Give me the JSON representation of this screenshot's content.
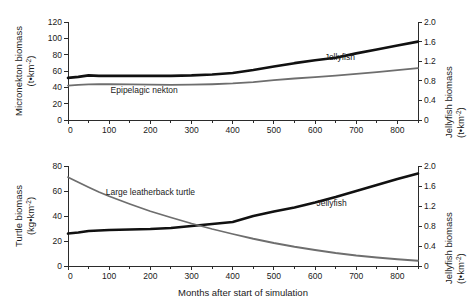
{
  "figure": {
    "xlabel": "Months after start of simulation",
    "background": "#ffffff",
    "series_colors": {
      "jellyfish": "#111111",
      "other": "#6e6e6e"
    }
  },
  "chart_data": [
    {
      "id": "top",
      "type": "line",
      "title": "",
      "xlabel": "",
      "ylabel": "Micronekton biomass (t•km⁻²)",
      "ylabel_line1": "Micronekton biomass",
      "ylabel_line2": "(t•km",
      "ylabel_line2_sup": "-2",
      "ylabel_line2_end": ")",
      "y2label_line1": "Jellyfish biomass",
      "y2label_line2": "(t•km",
      "y2label_line2_sup": "-2",
      "y2label_line2_end": ")",
      "xlim": [
        0,
        850
      ],
      "ylim": [
        0,
        120
      ],
      "y2lim": [
        0,
        2.0
      ],
      "xticks": [
        0,
        100,
        200,
        300,
        400,
        500,
        600,
        700,
        800
      ],
      "xminorticks": [
        50,
        150,
        250,
        350,
        450,
        550,
        650,
        750,
        850
      ],
      "yticks": [
        0,
        20,
        40,
        60,
        80,
        100,
        120
      ],
      "y2ticks": [
        0,
        0.4,
        0.8,
        1.2,
        1.6,
        2.0
      ],
      "y2ticklabels": [
        "0",
        "0.4",
        "0.8",
        "1.2",
        "1.6",
        "2.0"
      ],
      "grid": false,
      "legend_position": "inline-annotations",
      "series": [
        {
          "name": "Jellyfish",
          "axis": "right",
          "color": "#111111",
          "width": 2.6,
          "label": "Jellyfish",
          "label_x": 660,
          "label_y": 1.22,
          "x": [
            0,
            25,
            50,
            75,
            100,
            150,
            200,
            250,
            300,
            350,
            400,
            450,
            500,
            550,
            600,
            650,
            700,
            750,
            800,
            850
          ],
          "y": [
            0.86,
            0.88,
            0.91,
            0.9,
            0.9,
            0.9,
            0.9,
            0.9,
            0.91,
            0.93,
            0.96,
            1.02,
            1.09,
            1.16,
            1.22,
            1.27,
            1.36,
            1.44,
            1.52,
            1.6
          ]
        },
        {
          "name": "Epipelagic nekton",
          "axis": "left",
          "color": "#6e6e6e",
          "width": 1.8,
          "label": "Epipelagic nekton",
          "label_x": 185,
          "label_y": 33,
          "x": [
            0,
            25,
            50,
            75,
            100,
            150,
            200,
            250,
            300,
            350,
            400,
            450,
            500,
            550,
            600,
            650,
            700,
            750,
            800,
            850
          ],
          "y": [
            42.0,
            43.0,
            43.6,
            43.8,
            43.8,
            43.6,
            43.3,
            43.0,
            43.2,
            43.8,
            44.8,
            46.5,
            48.8,
            50.8,
            52.6,
            54.4,
            56.4,
            58.6,
            61.0,
            63.5
          ]
        }
      ]
    },
    {
      "id": "bottom",
      "type": "line",
      "title": "",
      "xlabel": "Months after start of simulation",
      "ylabel": "Turtle biomass (kg•km⁻²)",
      "ylabel_line1": "Turtle biomass",
      "ylabel_line2": "(kg•km",
      "ylabel_line2_sup": "-2",
      "ylabel_line2_end": ")",
      "y2label_line1": "Jellyfish biomass",
      "y2label_line2": "(t•km",
      "y2label_line2_sup": "-2",
      "y2label_line2_end": ")",
      "xlim": [
        0,
        850
      ],
      "ylim": [
        0,
        80
      ],
      "y2lim": [
        0,
        2.0
      ],
      "xticks": [
        0,
        100,
        200,
        300,
        400,
        500,
        600,
        700,
        800
      ],
      "xminorticks": [
        50,
        150,
        250,
        350,
        450,
        550,
        650,
        750,
        850
      ],
      "yticks": [
        0,
        20,
        40,
        60,
        80
      ],
      "y2ticks": [
        0,
        0.4,
        0.8,
        1.2,
        1.6,
        2.0
      ],
      "y2ticklabels": [
        "0",
        "0.4",
        "0.8",
        "1.2",
        "1.6",
        "2.0"
      ],
      "grid": false,
      "legend_position": "inline-annotations",
      "series": [
        {
          "name": "Jellyfish",
          "axis": "right",
          "color": "#111111",
          "width": 2.6,
          "label": "Jellyfish",
          "label_x": 640,
          "label_y": 1.2,
          "x": [
            0,
            25,
            50,
            75,
            100,
            150,
            200,
            250,
            300,
            350,
            400,
            450,
            500,
            550,
            600,
            650,
            700,
            750,
            800,
            850
          ],
          "y": [
            0.65,
            0.67,
            0.7,
            0.71,
            0.72,
            0.73,
            0.74,
            0.76,
            0.8,
            0.84,
            0.88,
            1.0,
            1.09,
            1.17,
            1.27,
            1.38,
            1.5,
            1.62,
            1.74,
            1.85
          ]
        },
        {
          "name": "Large leatherback turtle",
          "axis": "left",
          "color": "#6e6e6e",
          "width": 1.8,
          "label": "Large leatherback turtle",
          "label_x": 200,
          "label_y": 57,
          "x": [
            0,
            25,
            50,
            75,
            100,
            150,
            200,
            250,
            300,
            350,
            400,
            450,
            500,
            550,
            600,
            650,
            700,
            750,
            800,
            850
          ],
          "y": [
            71.0,
            67.0,
            63.0,
            59.2,
            55.8,
            49.6,
            43.8,
            38.8,
            34.0,
            29.6,
            25.6,
            21.8,
            18.4,
            15.4,
            12.8,
            10.4,
            8.4,
            6.8,
            5.4,
            4.2
          ]
        }
      ]
    }
  ]
}
